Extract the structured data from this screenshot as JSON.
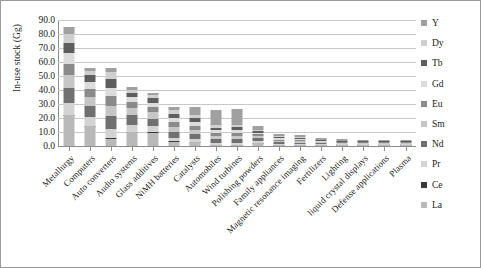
{
  "chart_data": {
    "type": "bar",
    "subtype": "stacked-vertical",
    "title": "",
    "xlabel": "",
    "ylabel": "In-use stock (Gg)",
    "ylim": [
      0,
      90
    ],
    "ytick_values": [
      0,
      10,
      20,
      30,
      40,
      50,
      60,
      70,
      80,
      90
    ],
    "ytick_labels": [
      "0.0",
      "10.0",
      "20.0",
      "30.0",
      "40.0",
      "50.0",
      "60.0",
      "70.0",
      "80.0",
      "90.0"
    ],
    "grid": true,
    "legend_position": "right",
    "categories": [
      "Metallurgy",
      "Computers",
      "Auto converters",
      "Audio systems",
      "Glass additives",
      "NiMH batteries",
      "Catalysts",
      "Automobiles",
      "Wind turbines",
      "Polishing powders",
      "Family appliances",
      "Magnetic resonance imaging",
      "Fertilizers",
      "Lighting",
      "liquid crystal displays",
      "Defense applications",
      "Plasma"
    ],
    "series": [
      {
        "name": "La",
        "color": "#b9b9b9",
        "values": [
          22.0,
          14.0,
          5.3,
          9.9,
          9.6,
          3.0,
          2.6,
          0.6,
          0.6,
          2.0,
          0.2,
          0.2,
          0.3,
          0.1,
          0.1,
          0.1,
          0.1
        ]
      },
      {
        "name": "Ce",
        "color": "#3a3a3a",
        "values": [
          0.4,
          0.4,
          0.3,
          0.3,
          0.3,
          0.3,
          0.3,
          0.2,
          0.2,
          0.2,
          0.1,
          0.1,
          0.2,
          0.1,
          0.1,
          0.1,
          0.1
        ]
      },
      {
        "name": "Pr",
        "color": "#d3d3d3",
        "values": [
          8.0,
          6.0,
          6.5,
          5.0,
          4.0,
          2.5,
          2.0,
          1.2,
          1.2,
          1.2,
          0.5,
          0.5,
          0.4,
          0.2,
          0.2,
          0.1,
          0.1
        ]
      },
      {
        "name": "Nd",
        "color": "#707070",
        "values": [
          11.0,
          8.0,
          9.0,
          6.5,
          5.5,
          4.0,
          3.5,
          2.5,
          2.6,
          1.8,
          1.2,
          1.1,
          0.7,
          0.4,
          0.3,
          0.2,
          0.1
        ]
      },
      {
        "name": "Sm",
        "color": "#c6c6c6",
        "values": [
          9.0,
          6.5,
          7.5,
          5.0,
          4.5,
          3.5,
          3.0,
          2.2,
          2.3,
          1.5,
          1.0,
          0.9,
          0.6,
          0.4,
          0.3,
          0.2,
          0.1
        ]
      },
      {
        "name": "Eu",
        "color": "#8a8a8a",
        "values": [
          8.5,
          6.0,
          7.0,
          4.5,
          4.0,
          3.5,
          3.0,
          2.2,
          2.2,
          1.4,
          1.0,
          0.9,
          0.6,
          0.4,
          0.3,
          0.2,
          0.1
        ]
      },
      {
        "name": "Gd",
        "color": "#dcdcdc",
        "values": [
          7.5,
          5.0,
          6.0,
          3.5,
          3.0,
          3.0,
          2.6,
          2.0,
          2.0,
          1.2,
          0.9,
          0.8,
          0.5,
          0.3,
          0.2,
          0.2,
          0.1
        ]
      },
      {
        "name": "Tb",
        "color": "#5e5e5e",
        "values": [
          7.0,
          4.5,
          6.0,
          3.0,
          3.0,
          3.0,
          2.6,
          2.0,
          2.0,
          1.1,
          0.8,
          0.7,
          0.5,
          0.3,
          0.2,
          0.1,
          0.05
        ]
      },
      {
        "name": "Dy",
        "color": "#cfcfcf",
        "values": [
          6.5,
          3.5,
          5.5,
          2.5,
          2.5,
          2.6,
          2.4,
          1.8,
          1.8,
          1.0,
          0.7,
          0.6,
          0.4,
          0.2,
          0.2,
          0.1,
          0.05
        ]
      },
      {
        "name": "Y",
        "color": "#a0a0a0",
        "values": [
          5.2,
          1.7,
          2.3,
          2.2,
          1.4,
          2.6,
          6.0,
          10.5,
          11.0,
          2.8,
          1.4,
          1.5,
          1.0,
          1.1,
          0.8,
          0.5,
          0.2
        ]
      }
    ],
    "totals": [
      85.1,
      55.6,
      55.4,
      42.4,
      37.8,
      28.0,
      28.0,
      25.2,
      25.9,
      14.2,
      7.8,
      7.3,
      5.2,
      3.5,
      2.7,
      1.8,
      1.0
    ]
  },
  "legend": {
    "items": [
      {
        "label": "Y",
        "color": "#a0a0a0"
      },
      {
        "label": "Dy",
        "color": "#cfcfcf"
      },
      {
        "label": "Tb",
        "color": "#5e5e5e"
      },
      {
        "label": "Gd",
        "color": "#dcdcdc"
      },
      {
        "label": "Eu",
        "color": "#8a8a8a"
      },
      {
        "label": "Sm",
        "color": "#c6c6c6"
      },
      {
        "label": "Nd",
        "color": "#707070"
      },
      {
        "label": "Pr",
        "color": "#d3d3d3"
      },
      {
        "label": "Ce",
        "color": "#3a3a3a"
      },
      {
        "label": "La",
        "color": "#b9b9b9"
      }
    ]
  }
}
